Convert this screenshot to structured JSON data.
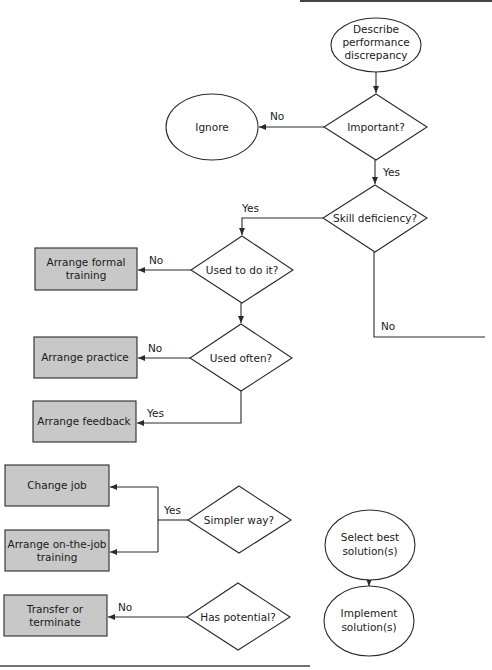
{
  "diagram": {
    "type": "flowchart",
    "colors": {
      "line": "#2a2a2a",
      "action_box_fill": "#c8c8c8",
      "background": "#ffffff"
    },
    "nodes": {
      "start": {
        "shape": "ellipse",
        "lines": [
          "Describe",
          "performance",
          "discrepancy"
        ]
      },
      "important": {
        "shape": "diamond",
        "lines": [
          "Important?"
        ]
      },
      "ignore": {
        "shape": "ellipse",
        "lines": [
          "Ignore"
        ]
      },
      "skill": {
        "shape": "diamond",
        "lines": [
          "Skill deficiency?"
        ]
      },
      "used_to": {
        "shape": "diamond",
        "lines": [
          "Used to do it?"
        ]
      },
      "formal": {
        "shape": "box",
        "lines": [
          "Arrange formal",
          "training"
        ]
      },
      "used_often": {
        "shape": "diamond",
        "lines": [
          "Used often?"
        ]
      },
      "practice": {
        "shape": "box",
        "lines": [
          "Arrange practice"
        ]
      },
      "feedback": {
        "shape": "box",
        "lines": [
          "Arrange feedback"
        ]
      },
      "change_job": {
        "shape": "box",
        "lines": [
          "Change job"
        ]
      },
      "ojt": {
        "shape": "box",
        "lines": [
          "Arrange on-the-job",
          "training"
        ]
      },
      "simpler": {
        "shape": "diamond",
        "lines": [
          "Simpler way?"
        ]
      },
      "transfer": {
        "shape": "box",
        "lines": [
          "Transfer or",
          "terminate"
        ]
      },
      "potential": {
        "shape": "diamond",
        "lines": [
          "Has potential?"
        ]
      },
      "select": {
        "shape": "ellipse",
        "lines": [
          "Select best",
          "solution(s)"
        ]
      },
      "implement": {
        "shape": "ellipse",
        "lines": [
          "Implement",
          "solution(s)"
        ]
      }
    },
    "edges": {
      "important_no": "No",
      "important_yes": "Yes",
      "skill_yes": "Yes",
      "skill_no": "No",
      "used_to_no": "No",
      "used_often_no": "No",
      "used_often_yes": "Yes",
      "simpler_yes": "Yes",
      "potential_no": "No"
    }
  }
}
